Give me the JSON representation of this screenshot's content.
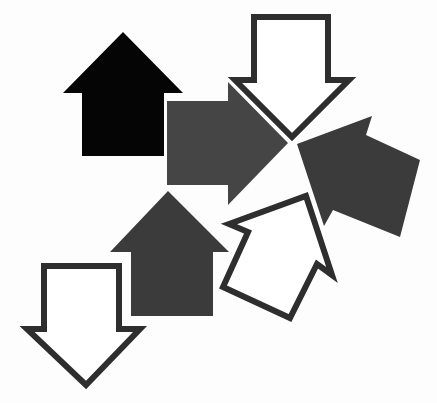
{
  "image": {
    "title": "",
    "description": "Clip-art arrangement of seven block arrows (filled and outlined) in black, dark gray and white"
  },
  "colors": {
    "background": "#fdfdfd",
    "black": "#050505",
    "dark_gray": "#3b3b3b",
    "mid_gray": "#454545",
    "outline": "#2e2e2e",
    "outline_fill": "#ffffff"
  },
  "shapes": [
    {
      "id": "black-up-arrow",
      "direction": "up",
      "style": "filled",
      "color": "black",
      "points": "123,32 183,93 164,93 164,156 82,156 82,93 63,93"
    },
    {
      "id": "gray-right-arrow",
      "direction": "right",
      "style": "filled",
      "color": "mid_gray",
      "points": "167,101 228,101 228,82 288,143 228,205 228,185 167,185"
    },
    {
      "id": "outline-down-arrow-top",
      "direction": "down",
      "style": "outlined",
      "color": "outline",
      "points": "254,17 328,17 328,80 349,80 292,137 235,80 254,80"
    },
    {
      "id": "gray-tilted-arrow",
      "direction": "up-left",
      "style": "filled",
      "color": "dark_gray",
      "points": "297,144 372,116 366,135 420,160 400,237 333,210 324,226"
    },
    {
      "id": "darkgray-up-arrow",
      "direction": "up",
      "style": "filled",
      "color": "dark_gray",
      "points": "168,191 229,252 213,252 213,316 131,316 131,252 110,252"
    },
    {
      "id": "outline-tilted-arrow",
      "direction": "up-right",
      "style": "outlined",
      "color": "outline",
      "points": "229,224 306,196 332,275 317,264 290,318 223,287 248,232"
    },
    {
      "id": "outline-down-arrow-bottom",
      "direction": "down",
      "style": "outlined",
      "color": "outline",
      "points": "44,266 119,266 119,329 140,329 86,385 27,329 44,329"
    }
  ]
}
